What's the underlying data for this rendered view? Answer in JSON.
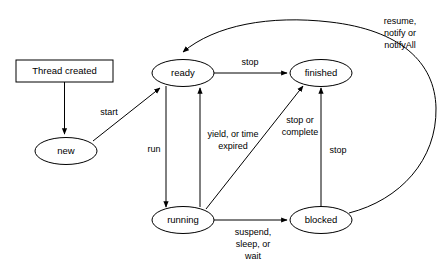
{
  "diagram": {
    "type": "state-diagram",
    "background_color": "#ffffff",
    "stroke_color": "#000000",
    "nodes": [
      {
        "id": "thread_created",
        "label": "Thread created",
        "shape": "rectangle",
        "cx": 64.5,
        "cy": 71,
        "rx": 48.5,
        "ry": 11
      },
      {
        "id": "new",
        "label": "new",
        "shape": "ellipse",
        "cx": 66,
        "cy": 151,
        "rx": 31,
        "ry": 13.5
      },
      {
        "id": "ready",
        "label": "ready",
        "shape": "ellipse",
        "cx": 183,
        "cy": 73,
        "rx": 31,
        "ry": 13.5
      },
      {
        "id": "finished",
        "label": "finished",
        "shape": "ellipse",
        "cx": 321,
        "cy": 73,
        "rx": 31,
        "ry": 13.5
      },
      {
        "id": "running",
        "label": "running",
        "shape": "ellipse",
        "cx": 183,
        "cy": 220,
        "rx": 31,
        "ry": 13.5
      },
      {
        "id": "blocked",
        "label": "blocked",
        "shape": "ellipse",
        "cx": 321,
        "cy": 220,
        "rx": 31,
        "ry": 13.5
      }
    ],
    "edges": [
      {
        "id": "created_to_new",
        "from": "thread_created",
        "to": "new",
        "label": ""
      },
      {
        "id": "new_to_ready",
        "from": "new",
        "to": "ready",
        "label": "start"
      },
      {
        "id": "ready_to_finished",
        "from": "ready",
        "to": "finished",
        "label": "stop"
      },
      {
        "id": "ready_to_running",
        "from": "ready",
        "to": "running",
        "label": "run"
      },
      {
        "id": "running_to_ready",
        "from": "running",
        "to": "ready",
        "label": "yield, or time expired",
        "label_lines": [
          "yield, or time",
          "expired"
        ]
      },
      {
        "id": "running_to_finished",
        "from": "running",
        "to": "finished",
        "label": "stop or complete",
        "label_lines": [
          "stop or",
          "complete"
        ]
      },
      {
        "id": "running_to_blocked",
        "from": "running",
        "to": "blocked",
        "label": "suspend, sleep, or wait",
        "label_lines": [
          "suspend,",
          "sleep, or",
          "wait"
        ]
      },
      {
        "id": "blocked_to_finished",
        "from": "blocked",
        "to": "finished",
        "label": "stop"
      },
      {
        "id": "blocked_to_ready",
        "from": "blocked",
        "to": "ready",
        "label": "resume, notify or notifyAll",
        "label_lines": [
          "resume,",
          "notify or",
          "notifyAll"
        ]
      }
    ],
    "labels": {
      "start": "start",
      "run": "run",
      "stop_ready_finished": "stop",
      "stop_blocked_finished": "stop",
      "yield_line1": "yield, or time",
      "yield_line2": "expired",
      "stop_complete_line1": "stop or",
      "stop_complete_line2": "complete",
      "suspend_line1": "suspend,",
      "suspend_line2": "sleep, or",
      "suspend_line3": "wait",
      "resume_line1": "resume,",
      "resume_line2": "notify or",
      "resume_line3": "notifyAll"
    }
  }
}
